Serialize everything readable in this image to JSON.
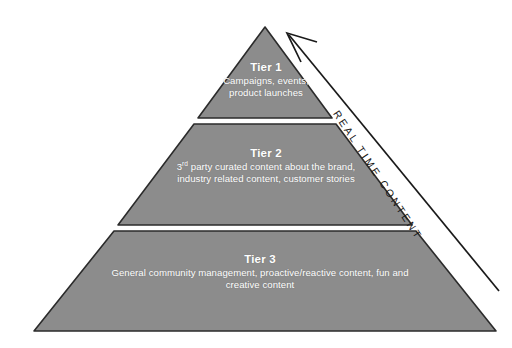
{
  "diagram": {
    "type": "pyramid",
    "background_color": "#ffffff",
    "tier_fill_color": "#8c8c8c",
    "tier_outline_color": "#2b2b2b",
    "tier_text_color": "#ffffff",
    "arrow_color": "#1a1a1a",
    "tiers": [
      {
        "id": "tier-1",
        "position": "top",
        "title": "Tier 1",
        "description_lines": [
          "Campaigns, events,",
          "product launches"
        ]
      },
      {
        "id": "tier-2",
        "position": "middle",
        "title": "Tier 2",
        "description_lines": [
          "3rd party curated content about the brand,",
          "industry related content, customer stories"
        ],
        "ordinal_prefix": "3",
        "ordinal_suffix": "rd",
        "description_line1_rest": " party curated content about the brand,"
      },
      {
        "id": "tier-3",
        "position": "bottom",
        "title": "Tier 3",
        "description_lines": [
          "General community management, proactive/reactive content, fun and",
          "creative content"
        ]
      }
    ],
    "arrow": {
      "label": "REAL TIME CONTENT",
      "direction": "up-left",
      "description": "Upward arrow along right side of pyramid"
    }
  }
}
